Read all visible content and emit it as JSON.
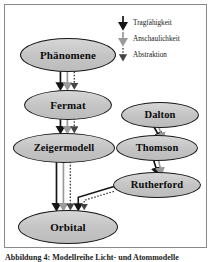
{
  "figure": {
    "title": "Modellreihe Licht- und Atommodelle",
    "caption": "Abbildung 4: Modellreihe Licht- und Atommodelle"
  },
  "legend": {
    "items": [
      {
        "label": "Tragfähigkeit",
        "icon": "arrow-down-solid-black-icon",
        "style": "solid",
        "color": "#1a1a1a"
      },
      {
        "label": "Anschaulichkeit",
        "icon": "arrow-down-solid-gray-icon",
        "style": "solid",
        "color": "#9a9a9a"
      },
      {
        "label": "Abstraktion",
        "icon": "arrow-down-dotted-icon",
        "style": "dotted",
        "color": "#3a3a3a"
      }
    ]
  },
  "nodes": [
    {
      "id": "phaenomene",
      "label": "Phänomene",
      "column": "left",
      "cx": 63,
      "cy": 50,
      "rx": 48,
      "ry": 17,
      "fontsize": 11
    },
    {
      "id": "fermat",
      "label": "Fermat",
      "column": "left",
      "cx": 63,
      "cy": 100,
      "rx": 44,
      "ry": 15,
      "fontsize": 11
    },
    {
      "id": "zeigermodell",
      "label": "Zeigermodell",
      "column": "left",
      "cx": 59,
      "cy": 143,
      "rx": 51,
      "ry": 15,
      "fontsize": 10.5
    },
    {
      "id": "orbital",
      "label": "Orbital",
      "column": "left",
      "cx": 63,
      "cy": 222,
      "rx": 50,
      "ry": 17,
      "fontsize": 11
    },
    {
      "id": "dalton",
      "label": "Dalton",
      "column": "right",
      "cx": 155,
      "cy": 110,
      "rx": 39,
      "ry": 13,
      "fontsize": 10.5
    },
    {
      "id": "thomson",
      "label": "Thomson",
      "column": "right",
      "cx": 152,
      "cy": 143,
      "rx": 41,
      "ry": 13,
      "fontsize": 10.5
    },
    {
      "id": "rutherford",
      "label": "Rutherford",
      "column": "right",
      "cx": 152,
      "cy": 180,
      "rx": 44,
      "ry": 13,
      "fontsize": 10.5
    }
  ],
  "edges": [
    {
      "from": "phaenomene",
      "to": "fermat",
      "kinds": [
        "Tragfähigkeit",
        "Anschaulichkeit",
        "Abstraktion"
      ]
    },
    {
      "from": "fermat",
      "to": "zeigermodell",
      "kinds": [
        "Tragfähigkeit",
        "Anschaulichkeit",
        "Abstraktion"
      ]
    },
    {
      "from": "zeigermodell",
      "to": "orbital",
      "kinds": [
        "Tragfähigkeit",
        "Anschaulichkeit",
        "Abstraktion"
      ]
    },
    {
      "from": "dalton",
      "to": "thomson",
      "kinds": [
        "Tragfähigkeit",
        "Anschaulichkeit"
      ]
    },
    {
      "from": "thomson",
      "to": "rutherford",
      "kinds": [
        "Tragfähigkeit",
        "Anschaulichkeit"
      ]
    },
    {
      "from": "rutherford",
      "to": "orbital",
      "kinds": [
        "Tragfähigkeit",
        "Abstraktion"
      ]
    }
  ],
  "colors": {
    "node_fill": "#c9c9c9",
    "node_stroke": "#1a1a1a",
    "frame": "#8a8a8a",
    "arrow_strong": "#1a1a1a",
    "arrow_light": "#9a9a9a",
    "background": "#ffffff"
  }
}
